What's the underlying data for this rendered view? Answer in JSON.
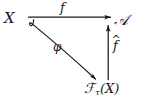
{
  "diagram": {
    "type": "commutative-triangle",
    "background_color": "#ffffff",
    "ink_color": "#1a1a1a",
    "nodes": [
      {
        "id": "x",
        "label": "X",
        "position": "top-left"
      },
      {
        "id": "a",
        "label": "A",
        "display": "𝒜",
        "position": "top-right"
      },
      {
        "id": "fx",
        "base": "ℱ",
        "subscript": "τ",
        "suffix": "(X)",
        "position": "bottom-right"
      }
    ],
    "edges": [
      {
        "id": "f",
        "label": "f",
        "from": "x",
        "to": "a",
        "direction": "right",
        "style": "straight-horizontal"
      },
      {
        "id": "phi",
        "label": "φ",
        "from": "x",
        "to": "fx",
        "direction": "down-right",
        "style": "hooked-diagonal"
      },
      {
        "id": "fhat",
        "label": "f",
        "accent": "̂",
        "from": "fx",
        "to": "a",
        "direction": "up",
        "style": "straight-vertical"
      }
    ]
  }
}
